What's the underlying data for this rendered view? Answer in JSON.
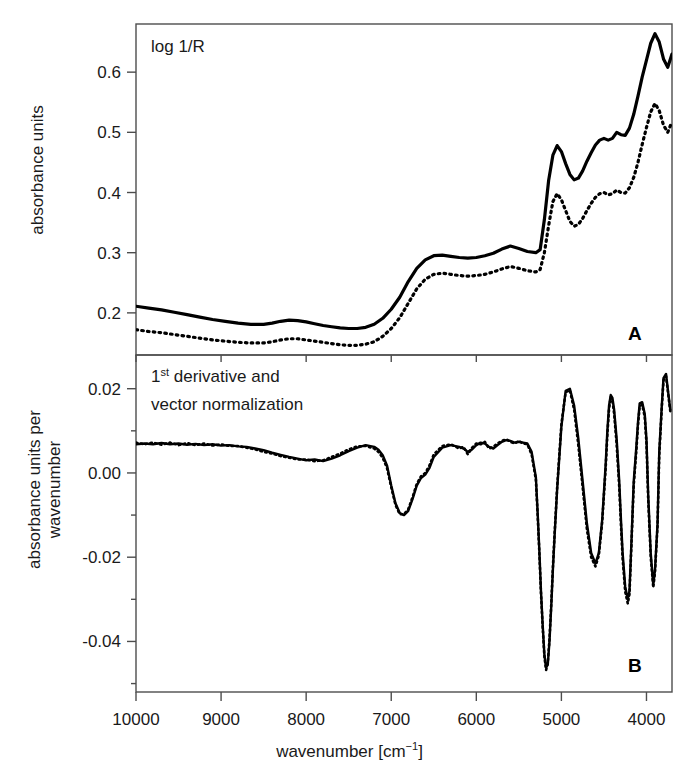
{
  "figure": {
    "xlabel_main": "wavenumber [cm",
    "xlabel_unit_sup": "−1",
    "xlabel_close": "]",
    "xtick_labels": [
      "10000",
      "9000",
      "8000",
      "7000",
      "6000",
      "5000",
      "4000"
    ]
  },
  "panelA": {
    "label": "A",
    "annotation": "log 1/R",
    "ylabel": "absorbance units",
    "ytick_labels": [
      "0.6",
      "0.5",
      "0.4",
      "0.3",
      "0.2"
    ]
  },
  "panelB": {
    "label": "B",
    "annotation_line1_num": "1",
    "annotation_line1_sup": "st",
    "annotation_line1_rest": " derivative and",
    "annotation_line2": "vector normalization",
    "ylabel_line1": "absorbance units per",
    "ylabel_line2": "wavenumber",
    "ytick_labels": [
      "0.02",
      "0.00",
      "-0.02",
      "-0.04"
    ]
  },
  "chart_data": [
    {
      "type": "line",
      "id": "panel-A",
      "title": "log 1/R",
      "xlabel": "wavenumber [cm-1]",
      "ylabel": "absorbance units",
      "xlim": [
        10000,
        3700
      ],
      "ylim": [
        0.13,
        0.68
      ],
      "x_reversed": true,
      "grid": false,
      "legend": "none",
      "xticks": [
        10000,
        9000,
        8000,
        7000,
        6000,
        5000,
        4000
      ],
      "yticks": [
        0.2,
        0.3,
        0.4,
        0.5,
        0.6
      ],
      "series": [
        {
          "name": "solid",
          "style": "solid",
          "x": [
            10000,
            9850,
            9700,
            9550,
            9400,
            9250,
            9100,
            8950,
            8800,
            8650,
            8500,
            8400,
            8300,
            8200,
            8100,
            8000,
            7900,
            7800,
            7700,
            7600,
            7500,
            7400,
            7300,
            7200,
            7100,
            7000,
            6900,
            6800,
            6700,
            6600,
            6500,
            6400,
            6300,
            6200,
            6100,
            6000,
            5900,
            5800,
            5700,
            5600,
            5500,
            5400,
            5300,
            5250,
            5200,
            5150,
            5100,
            5050,
            5000,
            4950,
            4900,
            4850,
            4800,
            4750,
            4700,
            4650,
            4600,
            4550,
            4500,
            4450,
            4400,
            4350,
            4300,
            4250,
            4200,
            4150,
            4100,
            4050,
            4000,
            3950,
            3900,
            3850,
            3800,
            3750,
            3700
          ],
          "y": [
            0.211,
            0.208,
            0.205,
            0.201,
            0.197,
            0.193,
            0.189,
            0.186,
            0.183,
            0.181,
            0.181,
            0.183,
            0.186,
            0.188,
            0.187,
            0.185,
            0.182,
            0.179,
            0.177,
            0.175,
            0.174,
            0.174,
            0.176,
            0.181,
            0.191,
            0.206,
            0.226,
            0.252,
            0.274,
            0.288,
            0.295,
            0.296,
            0.294,
            0.292,
            0.291,
            0.292,
            0.295,
            0.299,
            0.306,
            0.311,
            0.307,
            0.302,
            0.3,
            0.305,
            0.355,
            0.42,
            0.462,
            0.478,
            0.468,
            0.448,
            0.43,
            0.421,
            0.424,
            0.436,
            0.452,
            0.466,
            0.479,
            0.487,
            0.49,
            0.487,
            0.49,
            0.5,
            0.496,
            0.495,
            0.507,
            0.53,
            0.56,
            0.592,
            0.62,
            0.648,
            0.664,
            0.65,
            0.622,
            0.608,
            0.63
          ]
        },
        {
          "name": "dotted",
          "style": "dotted",
          "x": [
            10000,
            9850,
            9700,
            9550,
            9400,
            9250,
            9100,
            8950,
            8800,
            8650,
            8500,
            8400,
            8300,
            8200,
            8100,
            8000,
            7900,
            7800,
            7700,
            7600,
            7500,
            7400,
            7300,
            7200,
            7100,
            7000,
            6900,
            6800,
            6700,
            6600,
            6500,
            6400,
            6300,
            6200,
            6100,
            6000,
            5900,
            5800,
            5700,
            5600,
            5500,
            5400,
            5300,
            5250,
            5200,
            5150,
            5100,
            5050,
            5000,
            4950,
            4900,
            4850,
            4800,
            4750,
            4700,
            4650,
            4600,
            4550,
            4500,
            4450,
            4400,
            4350,
            4300,
            4250,
            4200,
            4150,
            4100,
            4050,
            4000,
            3950,
            3900,
            3850,
            3800,
            3750,
            3700
          ],
          "y": [
            0.172,
            0.169,
            0.167,
            0.164,
            0.161,
            0.158,
            0.155,
            0.153,
            0.151,
            0.15,
            0.15,
            0.152,
            0.155,
            0.157,
            0.157,
            0.155,
            0.153,
            0.151,
            0.149,
            0.147,
            0.146,
            0.146,
            0.148,
            0.152,
            0.161,
            0.174,
            0.192,
            0.216,
            0.24,
            0.256,
            0.264,
            0.266,
            0.264,
            0.262,
            0.261,
            0.262,
            0.264,
            0.268,
            0.273,
            0.277,
            0.274,
            0.27,
            0.268,
            0.272,
            0.3,
            0.345,
            0.385,
            0.398,
            0.388,
            0.37,
            0.352,
            0.344,
            0.347,
            0.357,
            0.37,
            0.382,
            0.392,
            0.398,
            0.4,
            0.396,
            0.398,
            0.404,
            0.4,
            0.399,
            0.408,
            0.425,
            0.45,
            0.48,
            0.508,
            0.534,
            0.548,
            0.536,
            0.512,
            0.5,
            0.518
          ]
        }
      ]
    },
    {
      "type": "line",
      "id": "panel-B",
      "title": "1st derivative and vector normalization",
      "xlabel": "wavenumber [cm-1]",
      "ylabel": "absorbance units per wavenumber",
      "xlim": [
        10000,
        3700
      ],
      "ylim": [
        -0.052,
        0.028
      ],
      "x_reversed": true,
      "grid": false,
      "legend": "none",
      "xticks": [
        10000,
        9000,
        8000,
        7000,
        6000,
        5000,
        4000
      ],
      "yticks": [
        -0.04,
        -0.02,
        0.0,
        0.02
      ],
      "series": [
        {
          "name": "solid",
          "style": "solid",
          "x": [
            10000,
            9900,
            9800,
            9700,
            9600,
            9500,
            9400,
            9300,
            9200,
            9100,
            9000,
            8900,
            8800,
            8700,
            8600,
            8500,
            8400,
            8300,
            8200,
            8100,
            8000,
            7900,
            7800,
            7700,
            7600,
            7500,
            7400,
            7300,
            7200,
            7150,
            7100,
            7050,
            7000,
            6950,
            6900,
            6850,
            6800,
            6750,
            6700,
            6650,
            6600,
            6550,
            6500,
            6400,
            6300,
            6200,
            6150,
            6100,
            6050,
            6000,
            5950,
            5900,
            5850,
            5800,
            5750,
            5700,
            5650,
            5600,
            5550,
            5500,
            5450,
            5400,
            5350,
            5300,
            5280,
            5260,
            5240,
            5220,
            5200,
            5180,
            5160,
            5140,
            5120,
            5100,
            5080,
            5050,
            5000,
            4950,
            4900,
            4850,
            4800,
            4750,
            4700,
            4650,
            4600,
            4560,
            4520,
            4480,
            4460,
            4440,
            4420,
            4400,
            4380,
            4350,
            4320,
            4300,
            4280,
            4250,
            4220,
            4200,
            4180,
            4150,
            4120,
            4100,
            4080,
            4050,
            4020,
            4000,
            3980,
            3950,
            3920,
            3900,
            3870,
            3850,
            3820,
            3800,
            3770,
            3750,
            3720,
            3700
          ],
          "y": [
            0.0068,
            0.007,
            0.0068,
            0.0071,
            0.0068,
            0.007,
            0.0067,
            0.0069,
            0.0066,
            0.0068,
            0.0065,
            0.0066,
            0.0063,
            0.0062,
            0.0058,
            0.0054,
            0.0048,
            0.0043,
            0.0038,
            0.0034,
            0.003,
            0.0032,
            0.0028,
            0.0034,
            0.0042,
            0.0052,
            0.006,
            0.0066,
            0.0062,
            0.0055,
            0.0042,
            0.0018,
            -0.003,
            -0.0072,
            -0.0095,
            -0.01,
            -0.009,
            -0.0062,
            -0.003,
            -0.0012,
            -0.0004,
            0.0012,
            0.0038,
            0.006,
            0.0066,
            0.0062,
            0.0058,
            0.005,
            0.0056,
            0.0066,
            0.0072,
            0.007,
            0.0062,
            0.0058,
            0.0066,
            0.0074,
            0.0078,
            0.0076,
            0.0072,
            0.0074,
            0.0072,
            0.007,
            0.005,
            -0.001,
            -0.009,
            -0.018,
            -0.028,
            -0.036,
            -0.043,
            -0.0462,
            -0.0455,
            -0.04,
            -0.032,
            -0.023,
            -0.015,
            -0.004,
            0.011,
            0.0195,
            0.02,
            0.016,
            0.008,
            -0.002,
            -0.012,
            -0.019,
            -0.0215,
            -0.019,
            -0.011,
            0.002,
            0.01,
            0.016,
            0.0185,
            0.0178,
            0.015,
            0.008,
            -0.002,
            -0.011,
            -0.019,
            -0.027,
            -0.03,
            -0.028,
            -0.018,
            -0.002,
            0.006,
            0.012,
            0.0165,
            0.0168,
            0.014,
            0.008,
            -0.005,
            -0.019,
            -0.0265,
            -0.023,
            -0.012,
            0.005,
            0.016,
            0.0225,
            0.0235,
            0.02,
            0.015
          ]
        },
        {
          "name": "dotted",
          "style": "dotted",
          "x": [
            10000,
            9900,
            9800,
            9700,
            9600,
            9500,
            9400,
            9300,
            9200,
            9100,
            9000,
            8900,
            8800,
            8700,
            8600,
            8500,
            8400,
            8300,
            8200,
            8100,
            8000,
            7900,
            7800,
            7700,
            7600,
            7500,
            7400,
            7300,
            7200,
            7150,
            7100,
            7050,
            7000,
            6950,
            6900,
            6850,
            6800,
            6750,
            6700,
            6650,
            6600,
            6550,
            6500,
            6400,
            6300,
            6200,
            6150,
            6100,
            6050,
            6000,
            5950,
            5900,
            5850,
            5800,
            5750,
            5700,
            5650,
            5600,
            5550,
            5500,
            5450,
            5400,
            5350,
            5300,
            5280,
            5260,
            5240,
            5220,
            5200,
            5180,
            5160,
            5140,
            5120,
            5100,
            5080,
            5050,
            5000,
            4950,
            4900,
            4850,
            4800,
            4750,
            4700,
            4650,
            4600,
            4560,
            4520,
            4480,
            4460,
            4440,
            4420,
            4400,
            4380,
            4350,
            4320,
            4300,
            4280,
            4250,
            4220,
            4200,
            4180,
            4150,
            4120,
            4100,
            4080,
            4050,
            4020,
            4000,
            3980,
            3950,
            3920,
            3900,
            3870,
            3850,
            3820,
            3800,
            3770,
            3750,
            3720,
            3700
          ],
          "y": [
            0.0072,
            0.0068,
            0.0072,
            0.0067,
            0.0072,
            0.0066,
            0.0071,
            0.0066,
            0.007,
            0.0065,
            0.0068,
            0.0064,
            0.0064,
            0.006,
            0.0056,
            0.005,
            0.0046,
            0.004,
            0.0036,
            0.0032,
            0.0032,
            0.0028,
            0.003,
            0.0038,
            0.0046,
            0.0056,
            0.0063,
            0.0064,
            0.0058,
            0.005,
            0.0036,
            0.0012,
            -0.0034,
            -0.0076,
            -0.0098,
            -0.0098,
            -0.0086,
            -0.0058,
            -0.0026,
            -0.0008,
            0.0,
            0.0018,
            0.0044,
            0.0064,
            0.0068,
            0.0058,
            0.0062,
            0.0044,
            0.006,
            0.007,
            0.0068,
            0.0074,
            0.0058,
            0.0062,
            0.007,
            0.0076,
            0.008,
            0.0074,
            0.007,
            0.0076,
            0.007,
            0.0068,
            0.0044,
            -0.0016,
            -0.0096,
            -0.0186,
            -0.0286,
            -0.0366,
            -0.0436,
            -0.0468,
            -0.045,
            -0.0394,
            -0.0314,
            -0.0224,
            -0.0144,
            -0.0034,
            0.0116,
            0.0192,
            0.0196,
            0.015,
            0.0064,
            -0.0034,
            -0.0134,
            -0.02,
            -0.0222,
            -0.0196,
            -0.0116,
            0.001,
            0.009,
            0.0152,
            0.018,
            0.0172,
            0.014,
            0.0066,
            -0.0034,
            -0.0124,
            -0.0204,
            -0.0282,
            -0.031,
            -0.0288,
            -0.0188,
            -0.003,
            0.005,
            0.0112,
            0.0158,
            0.0162,
            0.0132,
            0.007,
            -0.0062,
            -0.02,
            -0.0272,
            -0.0236,
            -0.0126,
            0.0042,
            0.0154,
            0.022,
            0.023,
            0.0196,
            0.0146
          ]
        }
      ]
    }
  ]
}
